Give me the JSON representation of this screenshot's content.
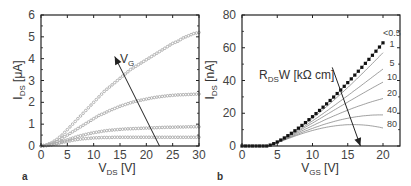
{
  "chart_data": [
    {
      "panel": "a",
      "type": "scatter",
      "xlabel": "V_DS [V]",
      "xlabel_main": "V",
      "xlabel_sub": "DS",
      "xlabel_unit": " [V]",
      "ylabel": "I_DS [μA]",
      "ylabel_main": "I",
      "ylabel_sub": "DS",
      "ylabel_unit": " [μA]",
      "xlim": [
        0,
        30
      ],
      "ylim": [
        0,
        6
      ],
      "xticks": [
        "0",
        "5",
        "10",
        "15",
        "20",
        "25",
        "30"
      ],
      "yticks": [
        "0",
        "1",
        "2",
        "3",
        "4",
        "5",
        "6"
      ],
      "annotation": {
        "text_main": "V",
        "text_sub": "G",
        "arrow_from": [
          22.5,
          0
        ],
        "arrow_to": [
          14,
          4.1
        ]
      },
      "x": [
        0,
        1,
        2,
        3,
        4,
        5,
        6,
        7,
        8,
        9,
        10,
        11,
        12,
        13,
        14,
        15,
        16,
        17,
        18,
        19,
        20,
        21,
        22,
        23,
        24,
        25,
        26,
        27,
        28,
        29,
        30
      ],
      "series": [
        {
          "name": "V_G highest",
          "values": [
            0,
            0.05,
            0.15,
            0.3,
            0.5,
            0.75,
            1.0,
            1.25,
            1.5,
            1.75,
            2.0,
            2.25,
            2.5,
            2.7,
            2.9,
            3.1,
            3.3,
            3.5,
            3.65,
            3.8,
            3.95,
            4.1,
            4.25,
            4.4,
            4.55,
            4.7,
            4.8,
            4.95,
            5.05,
            5.15,
            5.2
          ]
        },
        {
          "name": "V_G 3",
          "values": [
            0,
            0.03,
            0.1,
            0.2,
            0.35,
            0.5,
            0.65,
            0.8,
            0.95,
            1.1,
            1.25,
            1.4,
            1.5,
            1.62,
            1.72,
            1.82,
            1.9,
            1.98,
            2.05,
            2.1,
            2.15,
            2.2,
            2.24,
            2.27,
            2.3,
            2.32,
            2.34,
            2.35,
            2.36,
            2.37,
            2.38
          ]
        },
        {
          "name": "V_G 2",
          "values": [
            0,
            0.02,
            0.06,
            0.12,
            0.2,
            0.28,
            0.36,
            0.44,
            0.5,
            0.56,
            0.61,
            0.65,
            0.69,
            0.72,
            0.74,
            0.76,
            0.78,
            0.79,
            0.8,
            0.81,
            0.82,
            0.83,
            0.84,
            0.85,
            0.86,
            0.86,
            0.87,
            0.87,
            0.88,
            0.88,
            0.88
          ]
        },
        {
          "name": "V_G lowest",
          "values": [
            0,
            0.02,
            0.05,
            0.1,
            0.16,
            0.21,
            0.26,
            0.3,
            0.33,
            0.35,
            0.37,
            0.38,
            0.39,
            0.39,
            0.4,
            0.4,
            0.4,
            0.4,
            0.4,
            0.4,
            0.4,
            0.4,
            0.4,
            0.4,
            0.4,
            0.4,
            0.4,
            0.4,
            0.4,
            0.4,
            0.4
          ]
        }
      ]
    },
    {
      "panel": "b",
      "type": "line",
      "xlabel": "V_GS [V]",
      "xlabel_main": "V",
      "xlabel_sub": "GS",
      "xlabel_unit": " [V]",
      "ylabel": "I_DS [nA]",
      "ylabel_main": "I",
      "ylabel_sub": "DS",
      "ylabel_unit": " [nA]",
      "xlim": [
        0,
        22.5
      ],
      "ylim": [
        0,
        80
      ],
      "xticks": [
        "0",
        "5",
        "10",
        "15",
        "20"
      ],
      "yticks": [
        "0",
        "20",
        "40",
        "60",
        "80"
      ],
      "annotation": {
        "text_main": "R",
        "text_sub": "DS",
        "text_rest": "W [kΩ cm]",
        "arrow_from": [
          12.8,
          48
        ],
        "arrow_to": [
          16.8,
          0
        ]
      },
      "measured_points": {
        "x": [
          0,
          0.5,
          1,
          1.5,
          2,
          2.5,
          3,
          3.5,
          4,
          4.5,
          5,
          5.5,
          6,
          6.5,
          7,
          7.5,
          8,
          8.5,
          9,
          9.5,
          10,
          10.5,
          11,
          11.5,
          12,
          12.5,
          13,
          13.5,
          14,
          14.5,
          15,
          15.5,
          16,
          16.5,
          17,
          17.5,
          18,
          18.5,
          19,
          19.5,
          20
        ],
        "values": [
          0,
          0,
          0,
          0,
          0,
          0,
          0,
          0,
          0.8,
          2.2,
          3.8,
          5.5,
          7.3,
          9.2,
          11.2,
          13.2,
          15.3,
          17.4,
          19.6,
          21.8,
          24.1,
          26.4,
          28.7,
          31.1,
          33.5,
          35.9,
          38.4,
          40.9,
          43.4,
          45.9,
          48.5,
          51.1,
          53.7,
          56.3,
          58.9,
          61.6,
          64.2,
          66.9,
          69.6,
          72.3,
          63
        ]
      },
      "series": [
        {
          "name": "<0.5",
          "label": "<0.5",
          "end_value": 63
        },
        {
          "name": "1",
          "label": "1",
          "end_value": 57
        },
        {
          "name": "5",
          "label": "5",
          "end_value": 47
        },
        {
          "name": "10",
          "label": "10",
          "end_value": 39
        },
        {
          "name": "20",
          "label": "20",
          "end_value": 29
        },
        {
          "name": "40",
          "label": "40",
          "end_value": 19
        },
        {
          "name": "80",
          "label": "80",
          "end_value": 11
        }
      ],
      "legend_title": "R_DS W [kΩ cm]"
    }
  ],
  "labels": {
    "panel_a": "a",
    "panel_b": "b"
  }
}
